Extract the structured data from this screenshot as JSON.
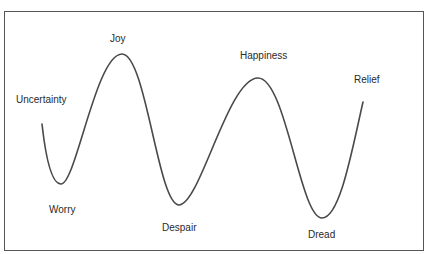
{
  "diagram": {
    "type": "emotional-journey-curve",
    "line_color": "#4a4a4a",
    "text_color": "#2a2a2a",
    "border_color": "#555555",
    "labels": [
      {
        "id": "uncertainty",
        "text": "Uncertainty",
        "position": "start"
      },
      {
        "id": "worry",
        "text": "Worry",
        "position": "trough"
      },
      {
        "id": "joy",
        "text": "Joy",
        "position": "peak"
      },
      {
        "id": "despair",
        "text": "Despair",
        "position": "trough"
      },
      {
        "id": "happiness",
        "text": "Happiness",
        "position": "peak"
      },
      {
        "id": "dread",
        "text": "Dread",
        "position": "trough"
      },
      {
        "id": "relief",
        "text": "Relief",
        "position": "end"
      }
    ]
  }
}
